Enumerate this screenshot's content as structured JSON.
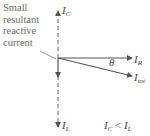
{
  "annotation": {
    "lines": [
      "Small",
      "resultant",
      "reactive",
      "current"
    ]
  },
  "phasors": {
    "ic": {
      "main": "I",
      "sub": "C"
    },
    "il": {
      "main": "I",
      "sub": "L"
    },
    "ir": {
      "main": "I",
      "sub": "R"
    },
    "itot": {
      "main": "I",
      "sub": "tot"
    },
    "angle": "θ"
  },
  "condition": {
    "lhs_main": "I",
    "lhs_sub": "C",
    "op": " < ",
    "rhs_main": "I",
    "rhs_sub": "L"
  },
  "colors": {
    "line": "#555555",
    "text": "#444444",
    "annotation": "#6a6a6a"
  }
}
